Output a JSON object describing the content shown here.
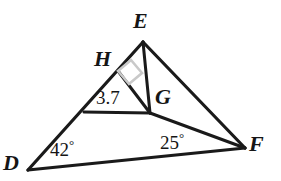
{
  "canvas": {
    "width": 281,
    "height": 181,
    "background": "#ffffff",
    "stroke_color": "#1a1a1a",
    "right_angle_color": "#c9c9c9"
  },
  "figure": {
    "type": "geometry-diagram",
    "shape": "triangle-with-cevian-and-altitude",
    "points": {
      "E": {
        "x": 143,
        "y": 42
      },
      "D": {
        "x": 28,
        "y": 170
      },
      "F": {
        "x": 245,
        "y": 148
      },
      "G": {
        "x": 150,
        "y": 113
      },
      "H": {
        "x": 118,
        "y": 71
      }
    },
    "segments": [
      {
        "name": "DE",
        "from": "D",
        "to": "E"
      },
      {
        "name": "DF",
        "from": "D",
        "to": "F"
      },
      {
        "name": "EF",
        "from": "E",
        "to": "F"
      },
      {
        "name": "EG",
        "from": "E",
        "to": "G"
      },
      {
        "name": "GF",
        "from": "G",
        "to": "F"
      },
      {
        "name": "HG",
        "from": "H",
        "to": "G"
      },
      {
        "name": "DG",
        "from": "D",
        "to": "G"
      }
    ],
    "right_angle_at": "H"
  },
  "labels": {
    "vertex_E": "E",
    "vertex_H": "H",
    "vertex_G": "G",
    "vertex_D": "D",
    "vertex_F": "F"
  },
  "measurements": {
    "length_DH": "3.7",
    "angle_D": "42",
    "angle_F": "25"
  },
  "top_clipped_text": "DIAGRAM IS NOT TO SCALE"
}
